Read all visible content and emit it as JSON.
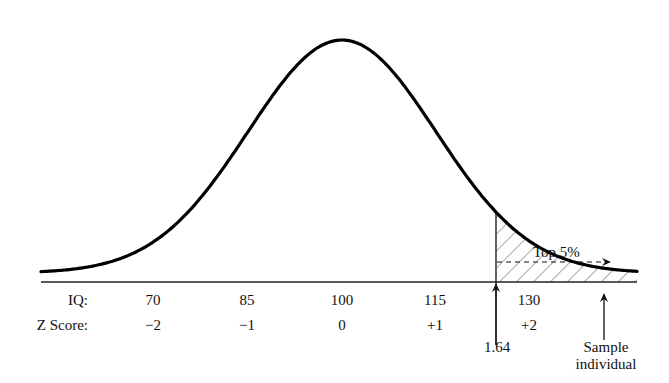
{
  "chart_data": {
    "type": "area",
    "title": "",
    "distribution": {
      "name": "normal",
      "mean": 100,
      "sd": 15
    },
    "rows": [
      {
        "label": "IQ:",
        "ticks": [
          "70",
          "85",
          "100",
          "115",
          "130"
        ],
        "values": [
          70,
          85,
          100,
          115,
          130
        ]
      },
      {
        "label": "Z Score:",
        "ticks": [
          "−2",
          "−1",
          "0",
          "+1",
          "+2"
        ],
        "values": [
          -2,
          -1,
          0,
          1,
          2
        ]
      }
    ],
    "xlim_z": [
      -3.2,
      3.15
    ],
    "shaded_region": {
      "from_z": 1.64,
      "to_z": "inf",
      "pattern": "diagonal-hatch",
      "label": "Top 5%",
      "percent": 5
    },
    "annotations": [
      {
        "text": "1.64",
        "z": 1.64,
        "type": "up-arrow"
      },
      {
        "text": "Top 5%",
        "type": "dashed-right-arrow"
      },
      {
        "text": "Sample individual",
        "line1": "Sample",
        "line2": "individual",
        "z": 2.76,
        "type": "up-arrow"
      }
    ],
    "grid": false,
    "legend": null
  },
  "labels": {
    "iq_row": "IQ:",
    "z_row": "Z Score:",
    "iq_ticks": [
      "70",
      "85",
      "100",
      "115",
      "130"
    ],
    "z_ticks": [
      "−2",
      "−1",
      "0",
      "+1",
      "+2"
    ],
    "cutoff": "1.64",
    "top": "Top 5%",
    "sample_line1": "Sample",
    "sample_line2": "individual"
  },
  "colors": {
    "curve": "#000000",
    "hatch": "#6a6a6a",
    "axis": "#222222",
    "background": "#ffffff"
  }
}
